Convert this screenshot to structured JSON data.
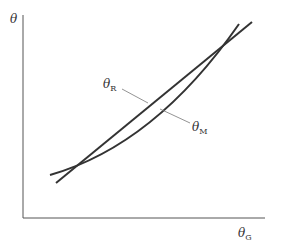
{
  "diagram": {
    "y_axis_label": "θ",
    "x_axis_label": "θ",
    "x_axis_label_sub": "G",
    "curves": [
      {
        "name": "theta-R",
        "label": "θ",
        "label_sub": "R",
        "shape": "straight line"
      },
      {
        "name": "theta-M",
        "label": "θ",
        "label_sub": "M",
        "shape": "slightly convex curve crossing the straight line twice"
      }
    ],
    "colors": {
      "line": "#333333",
      "axis": "#555555",
      "leader": "#777777"
    }
  }
}
